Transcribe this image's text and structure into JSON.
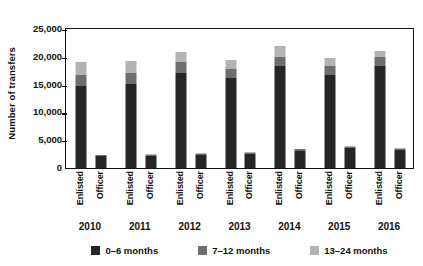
{
  "chart_data": {
    "type": "bar",
    "subtype": "stacked-bar-grouped",
    "title": "",
    "xlabel": "",
    "ylabel": "Number of transfers",
    "ylim": [
      0,
      25000
    ],
    "yticks": [
      0,
      5000,
      10000,
      15000,
      20000,
      25000
    ],
    "ytick_labels": [
      "0",
      "5,000",
      "10,000",
      "15,000",
      "20,000",
      "25,000"
    ],
    "grid": false,
    "legend_position": "bottom",
    "groups": [
      "2010",
      "2011",
      "2012",
      "2013",
      "2014",
      "2015",
      "2016"
    ],
    "categories": [
      "Enlisted 2010",
      "Officer 2010",
      "Enlisted 2011",
      "Officer 2011",
      "Enlisted 2012",
      "Officer 2012",
      "Enlisted 2013",
      "Officer 2013",
      "Enlisted 2014",
      "Officer 2014",
      "Enlisted 2015",
      "Officer 2015",
      "Enlisted 2016",
      "Officer 2016"
    ],
    "category_short": [
      "Enlisted",
      "Officer",
      "Enlisted",
      "Officer",
      "Enlisted",
      "Officer",
      "Enlisted",
      "Officer",
      "Enlisted",
      "Officer",
      "Enlisted",
      "Officer",
      "Enlisted",
      "Officer"
    ],
    "series": [
      {
        "name": "0–6 months",
        "color": "#262626",
        "values": [
          14800,
          2100,
          15100,
          2200,
          17000,
          2400,
          16200,
          2500,
          18300,
          3100,
          16700,
          3600,
          18300,
          3200
        ]
      },
      {
        "name": "7–12 months",
        "color": "#6e6e6e",
        "values": [
          2000,
          200,
          2000,
          200,
          2000,
          200,
          1700,
          200,
          1700,
          250,
          1700,
          250,
          1600,
          250
        ]
      },
      {
        "name": "13–24 months",
        "color": "#b3b3b3",
        "values": [
          2300,
          100,
          2100,
          100,
          1800,
          100,
          1500,
          100,
          2000,
          150,
          1400,
          150,
          1200,
          150
        ]
      }
    ],
    "totals": [
      19100,
      2400,
      19200,
      2500,
      20800,
      2700,
      19400,
      2800,
      22000,
      3500,
      19800,
      4000,
      21100,
      3600
    ]
  },
  "legend": {
    "items": [
      {
        "label": "0–6 months",
        "color": "#262626"
      },
      {
        "label": "7–12 months",
        "color": "#6e6e6e"
      },
      {
        "label": "13–24 months",
        "color": "#b3b3b3"
      }
    ]
  },
  "axis": {
    "y_title": "Number of transfers"
  }
}
